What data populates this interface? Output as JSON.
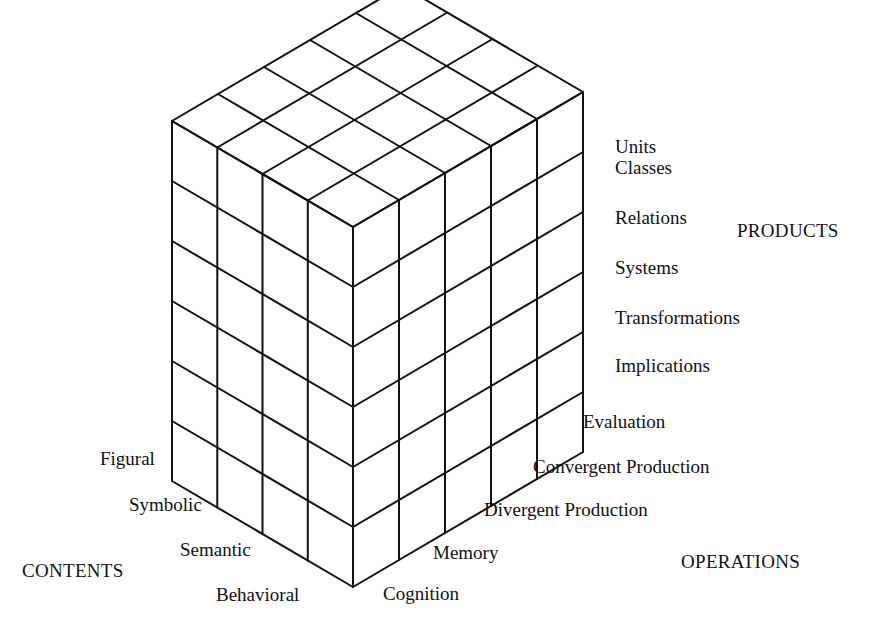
{
  "diagram": {
    "line_color": "#111111",
    "grid": {
      "contents_count": 4,
      "operations_count": 5,
      "products_count": 6
    }
  },
  "axes": {
    "products": {
      "title": "PRODUCTS",
      "items": [
        "Units",
        "Classes",
        "Relations",
        "Systems",
        "Transformations",
        "Implications"
      ]
    },
    "operations": {
      "title": "OPERATIONS",
      "items": [
        "Evaluation",
        "Convergent Production",
        "Divergent Production",
        "Memory",
        "Cognition"
      ]
    },
    "contents": {
      "title": "CONTENTS",
      "items": [
        "Figural",
        "Symbolic",
        "Semantic",
        "Behavioral"
      ]
    }
  }
}
